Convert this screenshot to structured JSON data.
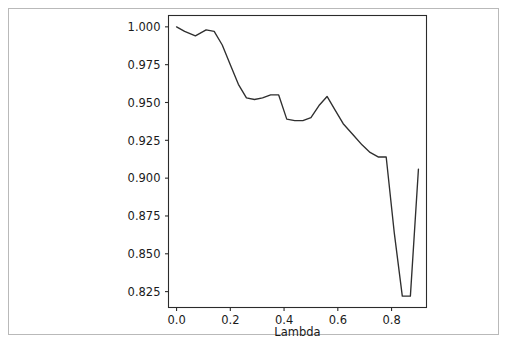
{
  "figure": {
    "background_color": "#ffffff",
    "border_color": "#b9b9b9",
    "line_color": "#2f2f2f",
    "axis_color": "#2b2b2b"
  },
  "chart_data": {
    "type": "line",
    "title": "",
    "subtitle": "",
    "xlabel": "Lambda",
    "ylabel": "",
    "grid": false,
    "legend": null,
    "xlim": [
      -0.03,
      0.93
    ],
    "ylim": [
      0.8145,
      1.0075
    ],
    "xticks": [
      0.0,
      0.2,
      0.4,
      0.6,
      0.8
    ],
    "xtick_labels": [
      "0.0",
      "0.2",
      "0.4",
      "0.6",
      "0.8"
    ],
    "yticks": [
      0.825,
      0.85,
      0.875,
      0.9,
      0.925,
      0.95,
      0.975,
      1.0
    ],
    "ytick_labels": [
      "0.825",
      "0.850",
      "0.875",
      "0.900",
      "0.925",
      "0.950",
      "0.975",
      "1.000"
    ],
    "series": [
      {
        "name": "accuracy",
        "x": [
          0.0,
          0.03,
          0.07,
          0.11,
          0.14,
          0.17,
          0.2,
          0.23,
          0.26,
          0.29,
          0.32,
          0.35,
          0.38,
          0.41,
          0.44,
          0.47,
          0.5,
          0.53,
          0.56,
          0.59,
          0.62,
          0.66,
          0.69,
          0.72,
          0.75,
          0.78,
          0.81,
          0.84,
          0.87,
          0.9
        ],
        "y": [
          1.0,
          0.997,
          0.994,
          0.998,
          0.997,
          0.988,
          0.975,
          0.962,
          0.953,
          0.952,
          0.953,
          0.955,
          0.955,
          0.939,
          0.938,
          0.938,
          0.94,
          0.948,
          0.954,
          0.945,
          0.936,
          0.928,
          0.922,
          0.917,
          0.914,
          0.914,
          0.864,
          0.822,
          0.822,
          0.906
        ]
      }
    ]
  }
}
